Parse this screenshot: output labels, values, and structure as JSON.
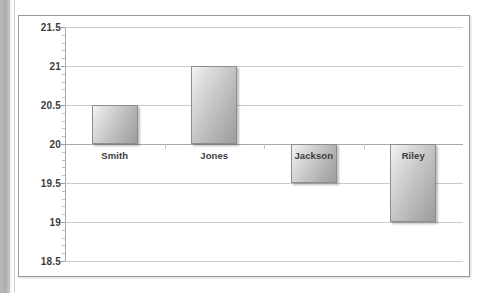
{
  "document": {
    "background_color": "#ffffff",
    "gutter_color": "#b0b0b0"
  },
  "chart_frame": {
    "border_color": "#9a9a9a",
    "plot_background": "#ffffff"
  },
  "chart_data": {
    "type": "bar",
    "title": "",
    "xlabel": "",
    "ylabel": "",
    "categories": [
      "Smith",
      "Jones",
      "Jackson",
      "Riley"
    ],
    "values": [
      20.5,
      21.0,
      19.5,
      19.0
    ],
    "baseline": 20.0,
    "ylim": [
      18.5,
      21.5
    ],
    "ytick_labels": [
      "21.5",
      "21",
      "20.5",
      "20",
      "19.5",
      "19",
      "18.5"
    ],
    "ytick_values": [
      21.5,
      21,
      20.5,
      20,
      19.5,
      19,
      18.5
    ],
    "minor_ticks_per_interval": 4,
    "grid": true,
    "gridline_color": "#c4cdd4",
    "axis_color": "#a9a9a9",
    "legend": null,
    "bar_fill_light": "#f0f0f0",
    "bar_fill_dark": "#9d9d9d",
    "bar_border_color": "#8d8d8d",
    "label_color": "#3d3d3d",
    "label_placement": [
      "below-axis",
      "below-axis",
      "inside-bar",
      "inside-bar"
    ]
  }
}
